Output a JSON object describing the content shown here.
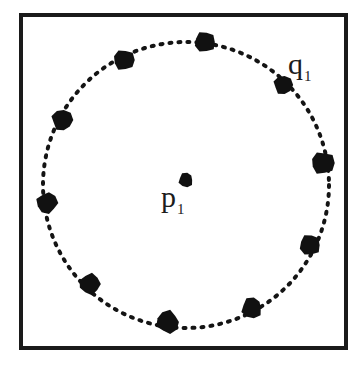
{
  "figure": {
    "width": 363,
    "height": 372,
    "background_color": "#ffffff",
    "frame": {
      "color": "#1a1a1a",
      "thickness": 4,
      "x": 19,
      "y": 13,
      "width": 329,
      "height": 337
    }
  },
  "labels": {
    "center_point": {
      "base": "p",
      "subscript": "1",
      "text": "p1"
    },
    "circle_point": {
      "base": "q",
      "subscript": "1",
      "text": "q1"
    }
  },
  "chart_data": {
    "type": "scatter",
    "xlabel": "",
    "ylabel": "",
    "xlim": [
      19,
      348
    ],
    "ylim": [
      13,
      350
    ],
    "grid": false,
    "legend": "none",
    "dot_color": "#111111",
    "circle": {
      "center_x": 186,
      "center_y": 185,
      "radius": 143,
      "stroke_color": "#141414",
      "stroke_width": 4,
      "dash_pattern": "2 7",
      "dash_cap": "round"
    },
    "center_point": {
      "label": "p1",
      "x": 186,
      "y": 180,
      "radius": 7
    },
    "boundary_points": [
      {
        "label": "",
        "x": 205,
        "y": 42,
        "radius": 10,
        "angle_deg": 82
      },
      {
        "label": "",
        "x": 124,
        "y": 60,
        "radius": 10,
        "angle_deg": 120
      },
      {
        "label": "",
        "x": 62,
        "y": 120,
        "radius": 10,
        "angle_deg": 152
      },
      {
        "label": "",
        "x": 47,
        "y": 203,
        "radius": 10,
        "angle_deg": 199
      },
      {
        "label": "",
        "x": 90,
        "y": 284,
        "radius": 10,
        "angle_deg": 233
      },
      {
        "label": "",
        "x": 168,
        "y": 322,
        "radius": 11,
        "angle_deg": 277
      },
      {
        "label": "",
        "x": 252,
        "y": 308,
        "radius": 10,
        "angle_deg": 304
      },
      {
        "label": "",
        "x": 310,
        "y": 245,
        "radius": 10,
        "angle_deg": 336
      },
      {
        "label": "",
        "x": 323,
        "y": 163,
        "radius": 11,
        "angle_deg": 9
      },
      {
        "label": "q1",
        "x": 283,
        "y": 85,
        "radius": 9,
        "angle_deg": 46
      }
    ]
  }
}
